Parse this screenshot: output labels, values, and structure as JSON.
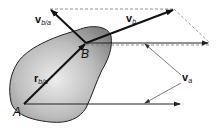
{
  "diagram": {
    "type": "rigid-body-relative-velocity",
    "colors": {
      "body_fill_light": "#e6e6e6",
      "body_fill_dark": "#8a8a8a",
      "body_stroke": "#222222",
      "vector": "#111111",
      "dashed": "#777777",
      "leader": "#444444"
    },
    "points": {
      "A": {
        "label": "A"
      },
      "B": {
        "label": "B"
      }
    },
    "vectors": {
      "r_ba": {
        "main": "r",
        "sub": "b/a"
      },
      "v_ba": {
        "main": "v",
        "sub": "b/a"
      },
      "v_b": {
        "main": "v",
        "sub": "b"
      },
      "v_a": {
        "main": "v",
        "sub": "a"
      }
    }
  }
}
